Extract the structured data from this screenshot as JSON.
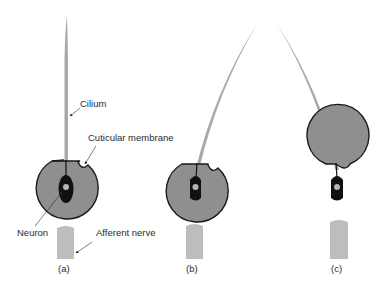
{
  "figure": {
    "colors": {
      "background": "#ffffff",
      "socket_fill": "#8f8f8f",
      "socket_outline": "#1a1a1a",
      "cilium": "#a9a9a9",
      "neuron": "#111111",
      "neuron_nucleus": "#b5b5b5",
      "nerve": "#bdbdbd",
      "text": "#2a2a2a"
    }
  },
  "labels": {
    "cilium": "Cilium",
    "cuticular_membrane": "Cuticular membrane",
    "neuron": "Neuron",
    "afferent_nerve": "Afferent nerve"
  },
  "panels": [
    {
      "id": "a",
      "label": "(a)",
      "state": "upright"
    },
    {
      "id": "b",
      "label": "(b)",
      "state": "deflected-right"
    },
    {
      "id": "c",
      "label": "(c)",
      "state": "deflected-left"
    }
  ]
}
